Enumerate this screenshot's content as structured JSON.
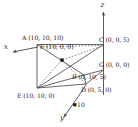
{
  "figure": {
    "type": "3d-coordinate-diagram",
    "stroke_color": "#4a4a4a",
    "text_color": "#1b1b1b",
    "background": "#ffffff",
    "axes": [
      {
        "name": "x-axis",
        "label": "x",
        "direction": "left-down"
      },
      {
        "name": "y-axis",
        "label": "y",
        "direction": "down-left"
      },
      {
        "name": "z-axis",
        "label": "z",
        "direction": "up"
      }
    ],
    "tick_marks": [
      {
        "axis": "y",
        "label": "10"
      }
    ],
    "points": [
      {
        "id": "A",
        "label": "A (10, 10, 10)",
        "coords": [
          10,
          10,
          10
        ]
      },
      {
        "id": "B",
        "label": "B (0, 10, 5)",
        "coords": [
          0,
          10,
          5
        ]
      },
      {
        "id": "C",
        "label": "C (0, 0, 5)",
        "coords": [
          0,
          0,
          5
        ]
      },
      {
        "id": "D",
        "label": "D (0, 5, 0)",
        "coords": [
          0,
          5,
          0
        ]
      },
      {
        "id": "E",
        "label": "E (10, 10, 0)",
        "coords": [
          10,
          10,
          0
        ]
      },
      {
        "id": "F",
        "label": "F (10, 0, 0)",
        "coords": [
          10,
          0,
          0
        ]
      },
      {
        "id": "G",
        "label": "G (0, 0, 0)",
        "coords": [
          0,
          0,
          0
        ]
      }
    ]
  }
}
